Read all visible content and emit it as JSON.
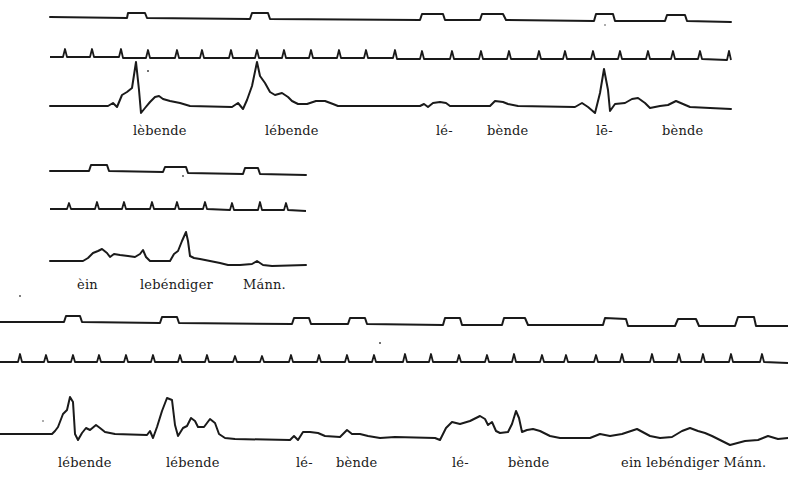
{
  "figure": {
    "ink_color": "#1a1a1a",
    "background_color": "#ffffff"
  },
  "strips": [
    {
      "id": "strip-1",
      "labels": [
        {
          "text": "lèbende",
          "x": 133,
          "y": 123
        },
        {
          "text": "lébende",
          "x": 265,
          "y": 123
        },
        {
          "text": "lé-",
          "x": 436,
          "y": 123
        },
        {
          "text": "bènde",
          "x": 487,
          "y": 123
        },
        {
          "text": "lē-",
          "x": 596,
          "y": 123
        },
        {
          "text": "bènde",
          "x": 662,
          "y": 123
        }
      ]
    },
    {
      "id": "strip-2",
      "labels": [
        {
          "text": "èin",
          "x": 77,
          "y": 277
        },
        {
          "text": "lebéndiger",
          "x": 140,
          "y": 277
        },
        {
          "text": "Mánn.",
          "x": 243,
          "y": 277
        }
      ]
    },
    {
      "id": "strip-3",
      "labels": [
        {
          "text": "lébende",
          "x": 58,
          "y": 455
        },
        {
          "text": "lébende",
          "x": 166,
          "y": 455
        },
        {
          "text": "lé-",
          "x": 296,
          "y": 455
        },
        {
          "text": "bènde",
          "x": 336,
          "y": 455
        },
        {
          "text": "lé-",
          "x": 452,
          "y": 455
        },
        {
          "text": "bènde",
          "x": 508,
          "y": 455
        },
        {
          "text": "ein lebéndiger Mánn.",
          "x": 621,
          "y": 455
        }
      ]
    }
  ]
}
